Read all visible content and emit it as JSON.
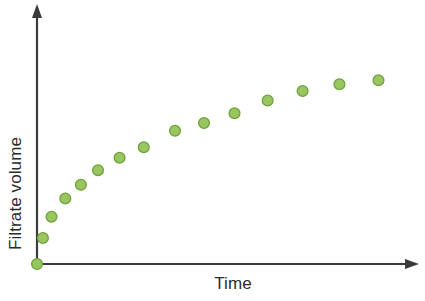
{
  "figure": {
    "background_color": "#ffffff",
    "axis_color": "#3b3b3b",
    "marker_fill": "#9ac560",
    "marker_edge": "#6fa33c",
    "label_color": "#2b2b2b"
  },
  "axes": {
    "y_label": "Filtrate volume",
    "x_label": "Time",
    "y_arrow_icon": "arrow-up-icon",
    "x_arrow_icon": "arrow-right-icon"
  },
  "chart_data": {
    "type": "scatter",
    "title": "",
    "xlabel": "Time",
    "ylabel": "Filtrate volume",
    "xlim": [
      0,
      100
    ],
    "ylim": [
      0,
      100
    ],
    "grid": false,
    "legend": null,
    "axis_ticks": {
      "x": [],
      "y": []
    },
    "series": [
      {
        "name": "Filtrate volume vs time",
        "marker": "circle",
        "color": "#9ac560",
        "x": [
          0,
          1.6,
          3.9,
          7.6,
          11.8,
          16.4,
          22.2,
          28.7,
          37.1,
          44.9,
          53.1,
          62.0,
          71.4,
          81.3,
          91.8
        ],
        "y": [
          0,
          10.4,
          18.9,
          26.2,
          31.7,
          37.5,
          42.5,
          46.7,
          53.3,
          56.4,
          60.3,
          65.4,
          69.2,
          71.9,
          73.5
        ]
      }
    ]
  }
}
